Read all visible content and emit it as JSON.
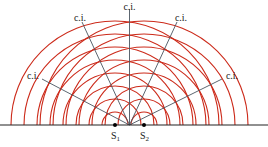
{
  "diagram": {
    "type": "two-source interference",
    "colors": {
      "wavefront": "#cc2a1a",
      "interference_line": "#4a5560",
      "baseline": "#222222",
      "source_dot": "#000000",
      "text": "#1a1a1a"
    },
    "sources": [
      {
        "label": "S",
        "sub": "1",
        "x": 115
      },
      {
        "label": "S",
        "sub": "2",
        "x": 144
      }
    ],
    "interference_labels": [
      {
        "text": "c.i.",
        "position": "top"
      },
      {
        "text": "c.i.",
        "position": "upper-left"
      },
      {
        "text": "c.i.",
        "position": "upper-right"
      },
      {
        "text": "c.i.",
        "position": "left"
      },
      {
        "text": "c.i.",
        "position": "right"
      }
    ]
  }
}
